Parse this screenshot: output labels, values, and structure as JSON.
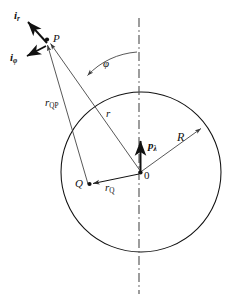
{
  "figure": {
    "kind": "geometry-diagram",
    "colors": {
      "stroke": "#111111",
      "thin_stroke": "#4a4a4a",
      "background": "#ffffff",
      "axis": "#555555"
    },
    "geometry": {
      "circle": {
        "cx": 141,
        "cy": 172,
        "r": 80
      },
      "origin": {
        "x": 141,
        "y": 172,
        "label": "0"
      },
      "point_P": {
        "x": 47,
        "y": 39,
        "label": "P"
      },
      "point_Q": {
        "x": 88,
        "y": 184,
        "label": "Q"
      },
      "axis_line": {
        "x": 139,
        "y1": 18,
        "y2": 294
      },
      "radius_arrow_end": {
        "x": 202,
        "y": 128
      },
      "angle_phi_deg": 35
    },
    "labels": {
      "unit_vector_r": {
        "base": "i",
        "sub": "r",
        "text": "ir"
      },
      "unit_vector_phi": {
        "base": "i",
        "sub": "φ",
        "text": "iφ"
      },
      "point_p": "P",
      "point_q": "Q",
      "origin": "0",
      "radius": "R",
      "r_vector": "r",
      "r_qp": {
        "base": "r",
        "sub": "QP"
      },
      "r_q": {
        "base": "r",
        "sub": "Q"
      },
      "dipole": {
        "base": "p",
        "sub": "λ"
      },
      "angle": "φ"
    }
  }
}
